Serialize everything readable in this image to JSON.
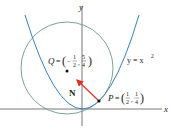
{
  "figure": {
    "axes": {
      "x_label": "x",
      "y_label": "y"
    },
    "curve": {
      "label": "y = x",
      "label_exponent": "2",
      "color": "#3a7fc1"
    },
    "circle": {
      "color": "#6d9a86"
    },
    "point_P": {
      "name": "P",
      "equals": "=",
      "x_num": "1",
      "x_den": "2",
      "y_num": "1",
      "y_den": "4"
    },
    "point_Q": {
      "name": "Q",
      "equals": "=",
      "x_sign": "−",
      "x_num": "1",
      "x_den": "2",
      "y_num": "5",
      "y_den": "4"
    },
    "normal_vector": {
      "label": "N",
      "color": "#d9342b"
    },
    "colors": {
      "axis": "#555555",
      "curve": "#3a7fc1",
      "circle": "#6d9a86",
      "vector": "#d9342b",
      "text": "#222222"
    }
  }
}
